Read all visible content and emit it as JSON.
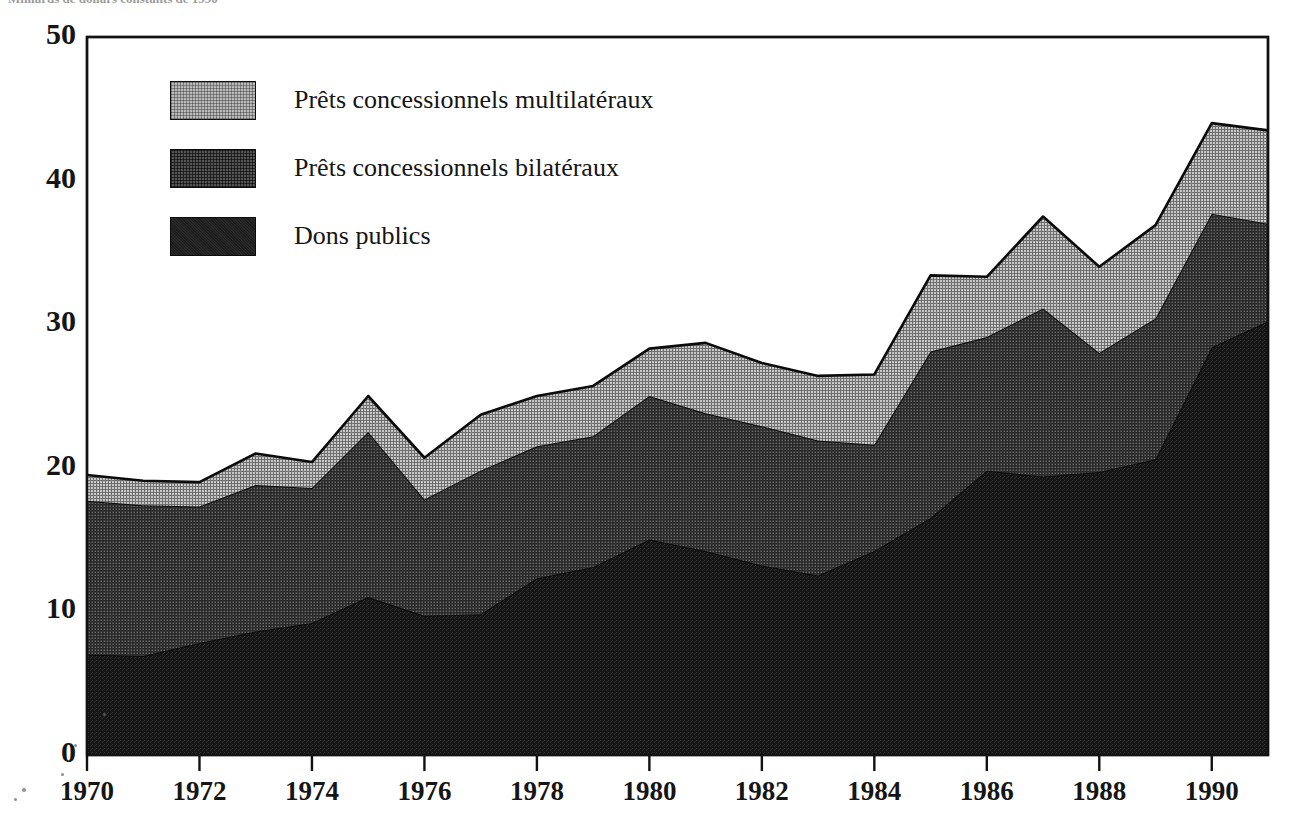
{
  "caption": {
    "text": "Milliards de dollars constants de 1990"
  },
  "chart_data": {
    "type": "area",
    "stacked": true,
    "title": "",
    "subtitle": "",
    "xlabel": "",
    "ylabel": "",
    "xlim": [
      1970,
      1991
    ],
    "ylim": [
      0,
      50
    ],
    "grid": false,
    "legend_position": "upper-left-inside",
    "y_ticks": [
      0,
      10,
      20,
      30,
      40,
      50
    ],
    "y_tick_labels": [
      "0",
      "10",
      "20",
      "30",
      "40",
      "50"
    ],
    "x_ticks": [
      1970,
      1972,
      1974,
      1976,
      1978,
      1980,
      1982,
      1984,
      1986,
      1988,
      1990
    ],
    "x_tick_labels": [
      "1970",
      "1972",
      "1974",
      "1976",
      "1978",
      "1980",
      "1982",
      "1984",
      "1986",
      "1988",
      "1990"
    ],
    "x": [
      1970,
      1971,
      1972,
      1973,
      1974,
      1975,
      1976,
      1977,
      1978,
      1979,
      1980,
      1981,
      1982,
      1983,
      1984,
      1985,
      1986,
      1987,
      1988,
      1989,
      1990,
      1991
    ],
    "series": [
      {
        "name": "Dons publics",
        "color": "#1d1d1d",
        "pattern": "solid-dark",
        "values": [
          7.0,
          6.9,
          7.8,
          8.6,
          9.2,
          11.0,
          9.7,
          9.8,
          12.3,
          13.1,
          15.0,
          14.2,
          13.2,
          12.5,
          14.2,
          16.5,
          19.8,
          19.4,
          19.7,
          20.6,
          28.4,
          30.2
        ]
      },
      {
        "name": "Prêts concessionnels bilatéraux",
        "color": "#545454",
        "pattern": "crosshatch-medium",
        "values": [
          10.7,
          10.5,
          9.5,
          10.2,
          9.4,
          11.5,
          8.1,
          10.0,
          9.2,
          9.1,
          10.0,
          9.6,
          9.7,
          9.4,
          7.4,
          11.6,
          9.3,
          11.7,
          8.3,
          9.8,
          9.3,
          6.8
        ]
      },
      {
        "name": "Prêts concessionnels multilatéraux",
        "color": "#b9b9b9",
        "pattern": "crosshatch-light",
        "values": [
          1.8,
          1.7,
          1.7,
          2.2,
          1.8,
          2.5,
          2.9,
          3.9,
          3.5,
          3.5,
          3.3,
          4.9,
          4.4,
          4.5,
          4.9,
          5.3,
          4.2,
          6.4,
          6.0,
          6.5,
          6.3,
          6.5
        ]
      }
    ],
    "totals": [
      19.5,
      19.1,
      19.0,
      21.0,
      20.4,
      25.0,
      20.7,
      23.7,
      25.0,
      25.7,
      28.3,
      28.7,
      27.3,
      26.4,
      26.5,
      33.4,
      33.3,
      37.5,
      34.0,
      36.9,
      44.0,
      43.5
    ]
  },
  "legend": {
    "items": [
      {
        "label": "Prêts concessionnels multilatéraux",
        "swatch_class": "sw-multilateral"
      },
      {
        "label": "Prêts concessionnels bilatéraux",
        "swatch_class": "sw-bilateral"
      },
      {
        "label": "Dons publics",
        "swatch_class": "sw-grants"
      }
    ]
  },
  "colors": {
    "axis": "#111111",
    "multilateral": "#b9b9b9",
    "bilateral": "#545454",
    "grants": "#1d1d1d",
    "background": "#ffffff"
  }
}
